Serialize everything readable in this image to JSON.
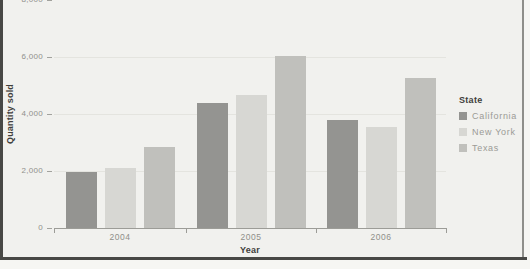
{
  "window": {
    "background_color": "#f1f1ee",
    "frame_color": "#484845"
  },
  "chart_data": {
    "type": "bar",
    "title": "",
    "categories": [
      "2004",
      "2005",
      "2006"
    ],
    "series": [
      {
        "name": "California",
        "color": "#949491",
        "values": [
          1950,
          4400,
          3800
        ]
      },
      {
        "name": "New York",
        "color": "#d7d7d3",
        "values": [
          2100,
          4650,
          3550
        ]
      },
      {
        "name": "Texas",
        "color": "#c0c0bc",
        "values": [
          2850,
          6050,
          5250
        ]
      }
    ],
    "xlabel": "Year",
    "ylabel": "Quantity sold",
    "ylim": [
      0,
      8000
    ],
    "ytick_values": [
      0,
      2000,
      4000,
      6000,
      8000
    ],
    "ytick_labels": [
      "0",
      "2,000",
      "4,000",
      "6,000",
      "8,000"
    ],
    "grid": "faint horizontal gridlines",
    "legend": {
      "title": "State",
      "position": "right",
      "entries": [
        "California",
        "New York",
        "Texas"
      ]
    }
  }
}
